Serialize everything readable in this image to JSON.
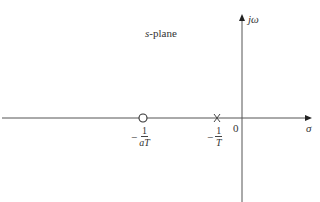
{
  "diagram": {
    "type": "pole-zero plot",
    "title": "s-plane",
    "title_prefix": "s",
    "title_suffix": "-plane",
    "axes": {
      "horizontal_label": "σ",
      "vertical_label": "jω",
      "origin_label": "0"
    },
    "markers": [
      {
        "kind": "zero",
        "symbol": "circle",
        "label_minus": "−",
        "label_num": "1",
        "label_den": "aT"
      },
      {
        "kind": "pole",
        "symbol": "cross",
        "label_minus": "−",
        "label_num": "1",
        "label_den": "T"
      }
    ],
    "colors": {
      "axis": "#555555",
      "text": "#333333",
      "background": "#ffffff"
    }
  }
}
